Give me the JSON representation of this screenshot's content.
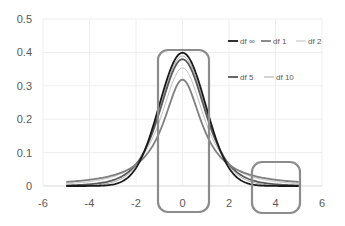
{
  "chart_data": {
    "type": "line",
    "title": "",
    "xlabel": "",
    "ylabel": "",
    "xlim": [
      -6,
      6
    ],
    "ylim": [
      0,
      0.5
    ],
    "x_ticks": [
      "-6",
      "-4",
      "-2",
      "0",
      "2",
      "4",
      "6"
    ],
    "y_ticks": [
      "0",
      "0.1",
      "0.2",
      "0.3",
      "0.4",
      "0.5"
    ],
    "grid": true,
    "legend_position": "upper right (inside plot)",
    "x_range_data": [
      -5,
      5
    ],
    "series": [
      {
        "name": "df ∞",
        "color": "#1a1a1a",
        "width": 1.8,
        "peak": 0.399
      },
      {
        "name": "df 1",
        "color": "#7f7f7f",
        "width": 1.8,
        "peak": 0.318
      },
      {
        "name": "df 2",
        "color": "#bfbfbf",
        "width": 1.0,
        "peak": 0.354
      },
      {
        "name": "df 5",
        "color": "#595959",
        "width": 1.8,
        "peak": 0.38
      },
      {
        "name": "df 10",
        "color": "#a6a6a6",
        "width": 1.0,
        "peak": 0.389
      }
    ],
    "sample_points": {
      "x": [
        -5,
        -4,
        -3,
        -2,
        -1,
        0,
        1,
        2,
        3,
        4,
        5
      ],
      "df ∞": [
        0.0,
        0.0001,
        0.0044,
        0.054,
        0.242,
        0.3989,
        0.242,
        0.054,
        0.0044,
        0.0001,
        0.0
      ],
      "df 1": [
        0.0122,
        0.0187,
        0.0318,
        0.0637,
        0.1592,
        0.3183,
        0.1592,
        0.0637,
        0.0318,
        0.0187,
        0.0122
      ],
      "df 2": [
        0.0071,
        0.0131,
        0.0274,
        0.068,
        0.1925,
        0.3536,
        0.1925,
        0.068,
        0.0274,
        0.0131,
        0.0071
      ],
      "df 5": [
        0.0018,
        0.0051,
        0.0173,
        0.0651,
        0.2197,
        0.3796,
        0.2197,
        0.0651,
        0.0173,
        0.0051,
        0.0018
      ],
      "df 10": [
        0.0004,
        0.002,
        0.0114,
        0.0611,
        0.2304,
        0.3891,
        0.2304,
        0.0611,
        0.0114,
        0.002,
        0.0004
      ]
    },
    "annotations": [
      {
        "type": "rounded-rectangle",
        "description": "highlights peak region around x=0",
        "x_range": [
          -1.1,
          1.1
        ],
        "y_range": [
          -0.08,
          0.41
        ]
      },
      {
        "type": "rounded-rectangle",
        "description": "highlights right tail around x=4",
        "x_range": [
          3.0,
          5.1
        ],
        "y_range": [
          -0.08,
          0.07
        ]
      }
    ]
  },
  "legend": {
    "row1": [
      "df ∞",
      "df 1",
      "df 2"
    ],
    "row2": [
      "df 5",
      "df 10"
    ]
  }
}
